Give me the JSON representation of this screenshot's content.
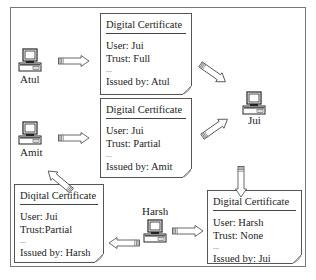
{
  "diagram": {
    "nodes": [
      {
        "id": "atul",
        "label": "Atul"
      },
      {
        "id": "amit",
        "label": "Amit"
      },
      {
        "id": "jui",
        "label": "Jui"
      },
      {
        "id": "harsh",
        "label": "Harsh"
      }
    ],
    "certificates": [
      {
        "title": "Digital Certificate",
        "user": "User: Jui",
        "trust": "Trust: Full",
        "ellipsis": "...",
        "issued_by": "Issued by: Atul"
      },
      {
        "title": "Digital Certificate",
        "user": "User: Jui",
        "trust": "Trust: Partial",
        "ellipsis": "...",
        "issued_by": "Issued by: Amit"
      },
      {
        "title": "Diqital Certificate",
        "user": "User: Jui",
        "trust": "Trust:Partial",
        "ellipsis": "...",
        "issued_by": "Issued by: Harsh"
      },
      {
        "title": "Digital Certificate",
        "user": "User: Harsh",
        "trust": "Trust: None",
        "ellipsis": "...",
        "issued_by": "Issued by: Jui"
      }
    ],
    "edges": [
      {
        "from": "Atul",
        "to": "Certificate 1"
      },
      {
        "from": "Certificate 1",
        "to": "Jui"
      },
      {
        "from": "Amit",
        "to": "Certificate 2"
      },
      {
        "from": "Certificate 2",
        "to": "Jui"
      },
      {
        "from": "Jui",
        "to": "Certificate 4"
      },
      {
        "from": "Harsh",
        "to": "Certificate 4"
      },
      {
        "from": "Harsh",
        "to": "Certificate 3"
      },
      {
        "from": "Certificate 3",
        "to": "Amit"
      }
    ]
  }
}
